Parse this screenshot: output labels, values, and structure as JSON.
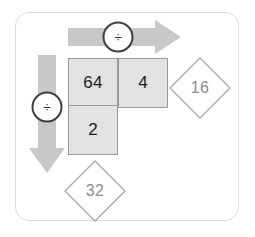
{
  "panel": {
    "name": "division-grid-diagram",
    "background_color": "#ffffff",
    "border_color": "#dcdcdc"
  },
  "colors": {
    "arrow_fill": "#c8c8c8",
    "cell_fill": "#e2e2e2",
    "cell_border": "#9a9a9a",
    "cell_text": "#1c1c1c",
    "diamond_outline": "#a8a8a8",
    "diamond_text": "#8d8d8d",
    "badge_outline": "#3f3f3f",
    "badge_fill": "#ffffff",
    "badge_text": "#2b2b2b"
  },
  "arrows": {
    "horizontal": {
      "name": "horizontal-division-arrow",
      "direction": "right",
      "operator_label": "÷"
    },
    "vertical": {
      "name": "vertical-division-arrow",
      "direction": "down",
      "operator_label": "÷"
    }
  },
  "grid": {
    "cells": [
      {
        "id": "cell-64",
        "value": "64",
        "row": 0,
        "col": 0
      },
      {
        "id": "cell-4",
        "value": "4",
        "row": 0,
        "col": 1
      },
      {
        "id": "cell-2",
        "value": "2",
        "row": 1,
        "col": 0
      }
    ]
  },
  "diamonds": [
    {
      "id": "diamond-16",
      "value": "16",
      "position": "right-of-top-row"
    },
    {
      "id": "diamond-32",
      "value": "32",
      "position": "below-left-column"
    }
  ]
}
